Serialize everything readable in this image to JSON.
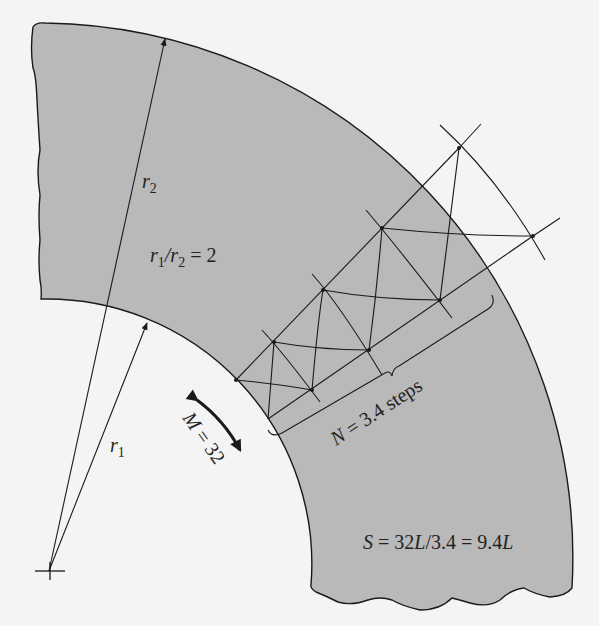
{
  "diagram": {
    "colors": {
      "background": "#f4f4f4",
      "shaded_region": "#b9b9b9",
      "stroke": "#1a1a1a"
    },
    "labels": {
      "r2": {
        "var": "r",
        "sub": "2"
      },
      "r1": {
        "var": "r",
        "sub": "1"
      },
      "ratio": {
        "a_var": "r",
        "a_sub": "1",
        "slash": "/",
        "b_var": "r",
        "b_sub": "2",
        "rest": " = 2"
      },
      "M": {
        "var": "M",
        "rest": " = 32"
      },
      "N": {
        "var": "N",
        "rest": " = 3.4 steps"
      },
      "S": {
        "p1": "S",
        "p2": " = 32",
        "p3": "L",
        "p4": "/3.4 = 9.4",
        "p5": "L"
      }
    },
    "values": {
      "r1_over_r2": 2,
      "M": 32,
      "N": 3.4,
      "S_expr": "32L/3.4",
      "S_result": "9.4L"
    }
  }
}
